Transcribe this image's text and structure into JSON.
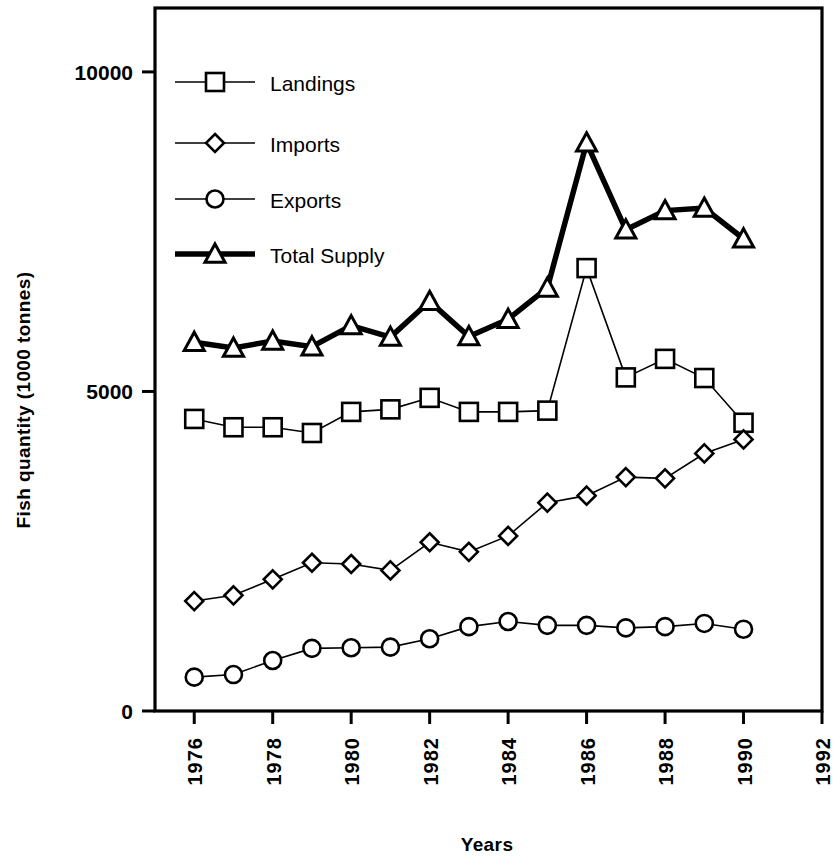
{
  "chart_data": {
    "type": "line",
    "title": "",
    "xlabel": "Years",
    "ylabel": "Fish quantity (1000 tonnes)",
    "x": [
      1976,
      1977,
      1978,
      1979,
      1980,
      1981,
      1982,
      1983,
      1984,
      1985,
      1986,
      1987,
      1988,
      1989,
      1990
    ],
    "xlim": [
      1975,
      1992
    ],
    "ylim": [
      0,
      11000
    ],
    "xticks": [
      1976,
      1978,
      1980,
      1982,
      1984,
      1986,
      1988,
      1990,
      1992
    ],
    "xtick_labels": [
      "1976",
      "1978",
      "1980",
      "1982",
      "1984",
      "1986",
      "1988",
      "1990",
      "1992"
    ],
    "yticks": [
      0,
      5000,
      10000
    ],
    "ytick_labels": [
      "0",
      "5000",
      "10000"
    ],
    "grid": false,
    "legend_position": "upper left",
    "series": [
      {
        "name": "Landings",
        "marker": "square",
        "linewidth": 1.6,
        "values": [
          4570,
          4440,
          4440,
          4350,
          4680,
          4720,
          4900,
          4680,
          4680,
          4700,
          6930,
          5220,
          5510,
          5210,
          4510
        ]
      },
      {
        "name": "Imports",
        "marker": "diamond",
        "linewidth": 1.6,
        "values": [
          1720,
          1810,
          2060,
          2320,
          2300,
          2200,
          2640,
          2490,
          2740,
          3260,
          3370,
          3660,
          3640,
          4030,
          4250
        ]
      },
      {
        "name": "Exports",
        "marker": "circle",
        "linewidth": 1.6,
        "values": [
          530,
          570,
          790,
          980,
          990,
          1000,
          1130,
          1320,
          1400,
          1340,
          1340,
          1300,
          1320,
          1370,
          1280
        ]
      },
      {
        "name": "Total Supply",
        "marker": "triangle",
        "linewidth": 5.5,
        "values": [
          5770,
          5680,
          5790,
          5700,
          6030,
          5850,
          6410,
          5860,
          6130,
          6620,
          8890,
          7530,
          7830,
          7870,
          7390
        ]
      }
    ]
  },
  "legend": {
    "entries": [
      {
        "label": "Landings",
        "marker": "square"
      },
      {
        "label": "Imports",
        "marker": "diamond"
      },
      {
        "label": "Exports",
        "marker": "circle"
      },
      {
        "label": "Total Supply",
        "marker": "triangle"
      }
    ]
  },
  "colors": {
    "ink": "#000000",
    "background": "#ffffff"
  }
}
